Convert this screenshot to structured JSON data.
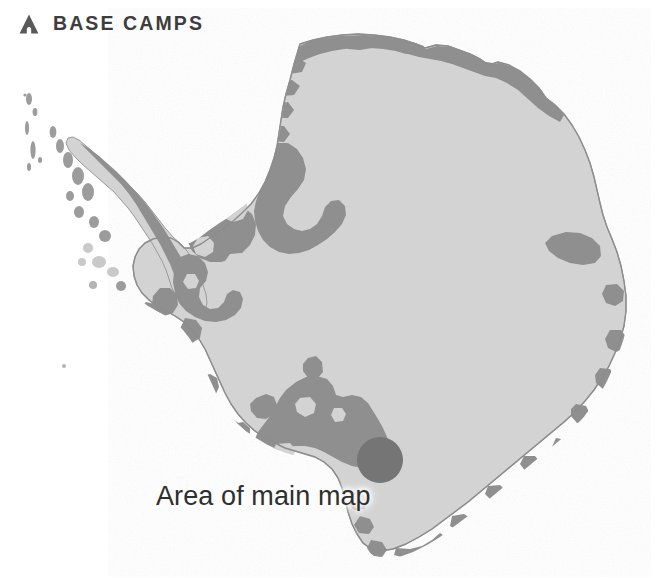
{
  "header": {
    "title": "BASE CAMPS",
    "icon": "tent-icon"
  },
  "map": {
    "subject": "Antarctica",
    "caption": "Area of main map",
    "marker": {
      "name": "area-of-main-map-marker",
      "shape": "circle",
      "cx": 380,
      "cy": 460,
      "r": 23,
      "color": "#757575"
    },
    "colors": {
      "background": "#ffffff",
      "ice_shelf": "#d3d3d3",
      "land_rock": "#8f8f8f",
      "coast_outline": "#8a8a8a",
      "text": "#2f2f2f",
      "header_text": "#3d3d3d",
      "icon": "#595959"
    },
    "legend": {
      "ice_shelf_label": "Ice shelf",
      "land_label": "Exposed land"
    }
  }
}
